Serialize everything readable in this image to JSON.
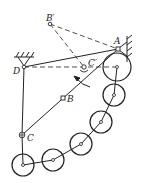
{
  "diagram": {
    "type": "linkage-mechanism",
    "colors": {
      "stroke": "#222222",
      "background": "#ffffff"
    },
    "labels": {
      "A": "A",
      "B": "B",
      "C": "C",
      "D": "D",
      "B_prime": "B′",
      "C_prime": "C′"
    },
    "points": {
      "A": [
        118,
        49
      ],
      "B": [
        63,
        98
      ],
      "C": [
        22,
        135
      ],
      "D": [
        24,
        67
      ],
      "B_prime": [
        50,
        24
      ],
      "C_prime": [
        85,
        68
      ]
    },
    "wheels": [
      {
        "cx": 117,
        "cy": 67,
        "r": 14
      },
      {
        "cx": 114,
        "cy": 95,
        "r": 11
      },
      {
        "cx": 101,
        "cy": 122,
        "r": 11
      },
      {
        "cx": 81,
        "cy": 144,
        "r": 11
      },
      {
        "cx": 53,
        "cy": 160,
        "r": 11
      },
      {
        "cx": 23,
        "cy": 165,
        "r": 11
      }
    ]
  }
}
